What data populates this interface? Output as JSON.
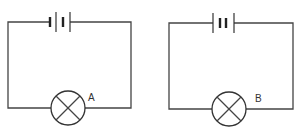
{
  "diagram": {
    "type": "circuit",
    "circuits": [
      {
        "id": "left",
        "lamp_label": "A",
        "battery": "two cells",
        "components": [
          "battery",
          "lamp"
        ]
      },
      {
        "id": "right",
        "lamp_label": "B",
        "battery": "two cells",
        "components": [
          "battery",
          "lamp"
        ]
      }
    ]
  }
}
